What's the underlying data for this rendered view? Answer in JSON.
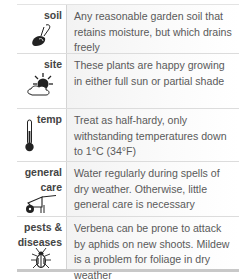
{
  "rows": [
    {
      "label": "soil",
      "icon": "trowel-icon",
      "text": "Any reasonable garden soil that retains moisture, but which drains freely"
    },
    {
      "label": "site",
      "icon": "sun-cloud-icon",
      "text": "These plants are happy growing in either full sun or partial shade"
    },
    {
      "label": "temp",
      "icon": "thermometer-icon",
      "text": "Treat as half-hardy, only withstanding temperatures down to 1°C (34°F)"
    },
    {
      "label_line1": "general",
      "label_line2": "care",
      "icon": "wheelbarrow-icon",
      "text": "Water regularly during spells of dry weather. Otherwise, little general care is necessary"
    },
    {
      "label_line1": "pests &",
      "label_line2": "diseases",
      "icon": "beetle-icon",
      "text": "Verbena can be prone to attack by aphids on new shoots. Mildew is a problem for foliage in dry weather"
    }
  ],
  "colors": {
    "label_text": "#444444",
    "body_text": "#5a5a5a",
    "rule": "#dcdcdc",
    "bottom_rule": "#c8c8c8"
  }
}
